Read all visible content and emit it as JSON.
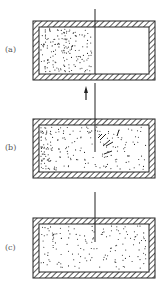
{
  "figure": {
    "panels": [
      {
        "id": "a",
        "label": "(a)",
        "description": "Gas confined to left half of insulated container by partition"
      },
      {
        "id": "b",
        "label": "(b)",
        "description": "Partition removed; gas expanding into right half"
      },
      {
        "id": "c",
        "label": "(c)",
        "description": "Gas uniformly filling the whole container"
      }
    ],
    "arrow": {
      "direction": "up",
      "meaning": "partition lifted"
    },
    "colors": {
      "ink": "#222222",
      "hatch": "#333333",
      "background": "#ffffff"
    }
  }
}
